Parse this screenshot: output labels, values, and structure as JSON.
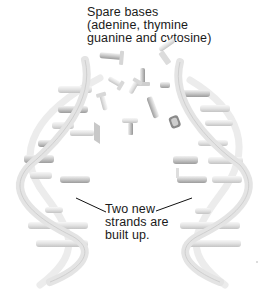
{
  "diagram": {
    "labels": {
      "spare_bases": {
        "line1": "Spare bases",
        "line2": "(adenine, thymine",
        "line3": "guanine and cytosine)"
      },
      "new_strands": {
        "line1": "Two new",
        "line2": "strands are",
        "line3": "built up."
      }
    },
    "colors": {
      "background": "#ffffff",
      "strand": "#e6e6e6",
      "strand_edge": "#c8c8c8",
      "base_light": "#dcdcdc",
      "base_dark": "#9a9a9a",
      "text": "#1a1a1a",
      "pointer": "#111111"
    }
  }
}
